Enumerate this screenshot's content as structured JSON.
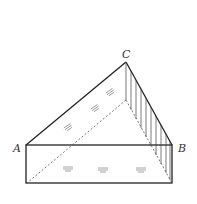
{
  "figure": {
    "labels": {
      "A": "A",
      "B": "B",
      "C": "C"
    },
    "points": {
      "A": [
        26,
        145
      ],
      "B": [
        172,
        145
      ],
      "C": [
        126,
        62
      ],
      "hidden_base": [
        126,
        100
      ],
      "bottom_left": [
        26,
        183
      ],
      "bottom_right": [
        172,
        183
      ]
    },
    "water_marks": [
      "≡",
      "≡",
      "≡",
      "≡",
      "≡",
      "≡"
    ],
    "colors": {
      "line": "#222222",
      "dashed": "#555555",
      "hatch": "#444444"
    }
  }
}
